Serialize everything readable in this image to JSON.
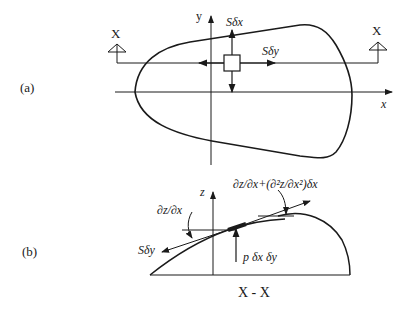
{
  "figure": {
    "part_a": {
      "label": "(a)",
      "y_axis_label": "y",
      "x_axis_label": "x",
      "section_marker_left": "X",
      "section_marker_right": "X",
      "force_up_label": "Sδx",
      "force_right_label": "Sδy"
    },
    "part_b": {
      "label": "(b)",
      "z_axis_label": "z",
      "slope_left_label": "∂z/∂x",
      "slope_right_label": "∂z/∂x+(∂²z/∂x²)δx",
      "tension_label": "Sδy",
      "pressure_label": "p δx δy",
      "section_label": "X - X"
    },
    "colors": {
      "ink": "#1a1a1a",
      "background": "#ffffff"
    }
  }
}
